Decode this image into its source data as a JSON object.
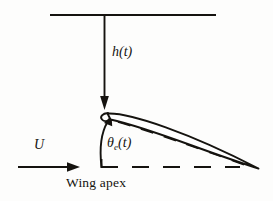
{
  "figure": {
    "background_color": "#fdfdfc",
    "ink_color": "#15130f",
    "width": 273,
    "height": 201
  },
  "labels": {
    "plunge": {
      "symbol": "h",
      "argument": "(t)",
      "text": "h(t)",
      "meaning": "vertical plunge displacement"
    },
    "pitch": {
      "symbol": "θ",
      "subscript": "e",
      "argument": "(t)",
      "text": "θe(t)",
      "meaning": "effective pitch angle"
    },
    "velocity": {
      "text": "U",
      "meaning": "freestream velocity"
    },
    "apex": {
      "text": "Wing apex",
      "meaning": "leading edge reference point"
    }
  },
  "elements": {
    "reference_line": {
      "name": "top-reference-line",
      "type": "solid-horizontal",
      "x1": 50,
      "y1": 15,
      "x2": 216,
      "y2": 15
    },
    "plunge_arrow": {
      "name": "plunge-arrow",
      "type": "arrow-down",
      "x1": 104,
      "y1": 15,
      "x2": 104,
      "y2": 107
    },
    "velocity_arrow": {
      "name": "velocity-arrow",
      "type": "arrow-right",
      "x1": 18,
      "y1": 167,
      "x2": 79,
      "y2": 167
    },
    "chord_dashed_line": {
      "name": "horizontal-dashed-reference",
      "type": "dashed-horizontal",
      "x1": 101,
      "y1": 167,
      "x2": 240,
      "y2": 167
    },
    "angle_arc": {
      "name": "pitch-angle-arc",
      "type": "curved-arrow",
      "from_x": 101,
      "from_y": 167,
      "to_x": 110,
      "to_y": 118
    },
    "airfoil": {
      "name": "airfoil-body",
      "type": "lens-shape",
      "leading_edge_x": 107,
      "leading_edge_y": 112,
      "trailing_edge_x": 258,
      "trailing_edge_y": 168,
      "camber_dashed": true
    }
  }
}
